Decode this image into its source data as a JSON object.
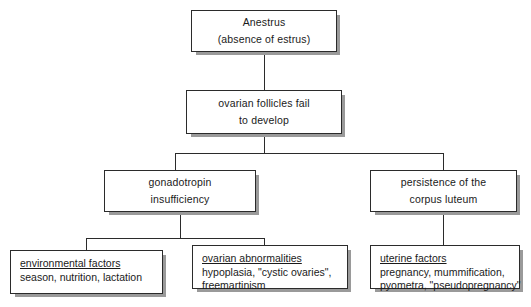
{
  "diagram": {
    "nodes": {
      "anestrus": {
        "line1": "Anestrus",
        "line2": "(absence of estrus)"
      },
      "follicles": {
        "line1": "ovarian follicles fail",
        "line2": "to develop"
      },
      "gonadotropin": {
        "line1": "gonadotropin",
        "line2": "insufficiency"
      },
      "corpus_luteum": {
        "line1": "persistence of the",
        "line2": "corpus luteum"
      },
      "environmental": {
        "heading": "environmental factors",
        "line1": "season, nutrition, lactation",
        "line2": ""
      },
      "ovarian": {
        "heading": "ovarian abnormalities",
        "line1": "hypoplasia, \"cystic ovaries\",",
        "line2": "freemartinism"
      },
      "uterine": {
        "heading": "uterine factors",
        "line1": "pregnancy, mummification,",
        "line2": "pyometra, \"pseudopregnancy\""
      }
    },
    "colors": {
      "box_border": "#2b2b2b",
      "box_fill": "#ffffff",
      "shadow": "#9a9a9a",
      "connector": "#2b2b2b",
      "text": "#1a1a1a"
    }
  }
}
